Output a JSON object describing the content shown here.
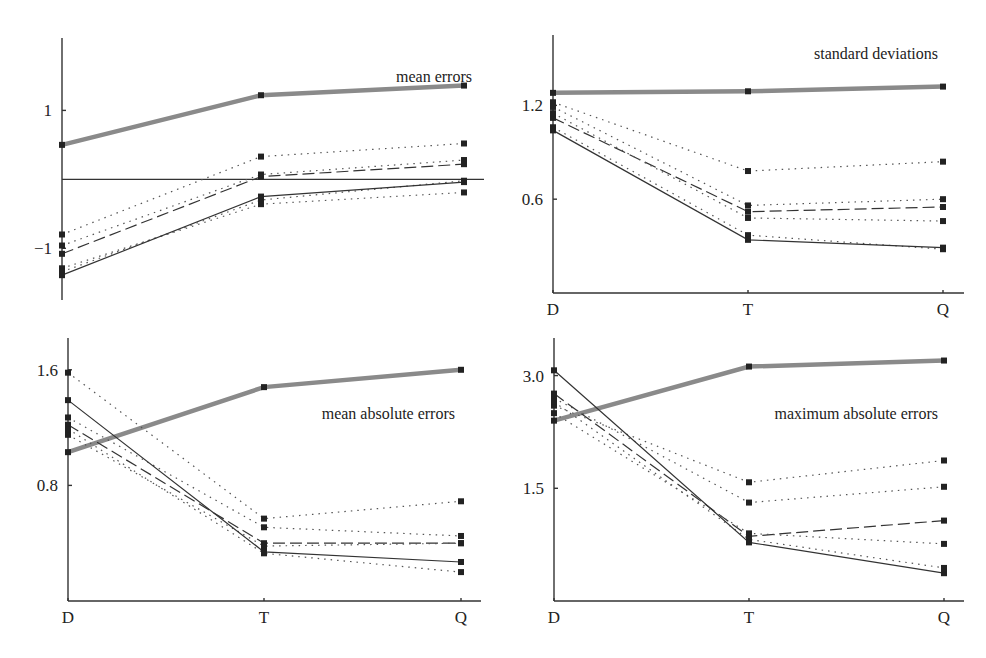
{
  "chart_data": [
    {
      "type": "line",
      "title": "mean errors",
      "categories": [
        "D",
        "T",
        "Q"
      ],
      "show_x_labels": false,
      "yticks": [
        {
          "value": 1,
          "label": "1"
        },
        {
          "value": -1,
          "label": "−1"
        }
      ],
      "ylim": [
        -1.75,
        2.05
      ],
      "zero_line": true,
      "series": [
        {
          "name": "heavy",
          "style": "heavy",
          "values": [
            0.5,
            1.22,
            1.36
          ]
        },
        {
          "name": "dotted-a",
          "style": "dotted",
          "values": [
            -0.8,
            0.33,
            0.52
          ]
        },
        {
          "name": "dotted-b",
          "style": "dotted",
          "values": [
            -0.96,
            0.07,
            0.28
          ]
        },
        {
          "name": "dashed",
          "style": "dashed",
          "values": [
            -1.08,
            0.04,
            0.22
          ]
        },
        {
          "name": "dotted-c",
          "style": "dotted",
          "values": [
            -1.29,
            -0.36,
            -0.19
          ]
        },
        {
          "name": "dotted-d",
          "style": "dotted",
          "values": [
            -1.34,
            -0.3,
            -0.02
          ]
        },
        {
          "name": "solid",
          "style": "solid",
          "values": [
            -1.39,
            -0.25,
            -0.04
          ]
        }
      ]
    },
    {
      "type": "line",
      "title": "standard deviations",
      "categories": [
        "D",
        "T",
        "Q"
      ],
      "show_x_labels": true,
      "yticks": [
        {
          "value": 1.2,
          "label": "1.2"
        },
        {
          "value": 0.6,
          "label": "0.6"
        }
      ],
      "ylim": [
        0.0,
        1.65
      ],
      "zero_line": false,
      "series": [
        {
          "name": "heavy",
          "style": "heavy",
          "values": [
            1.28,
            1.29,
            1.32
          ]
        },
        {
          "name": "dotted-a",
          "style": "dotted",
          "values": [
            1.22,
            0.78,
            0.84
          ]
        },
        {
          "name": "dotted-b",
          "style": "dotted",
          "values": [
            1.19,
            0.56,
            0.6
          ]
        },
        {
          "name": "dashed",
          "style": "dashed",
          "values": [
            1.12,
            0.52,
            0.55
          ]
        },
        {
          "name": "dotted-c",
          "style": "dotted",
          "values": [
            1.15,
            0.48,
            0.46
          ]
        },
        {
          "name": "dotted-d",
          "style": "dotted",
          "values": [
            1.06,
            0.37,
            0.28
          ]
        },
        {
          "name": "solid",
          "style": "solid",
          "values": [
            1.04,
            0.34,
            0.29
          ]
        }
      ]
    },
    {
      "type": "line",
      "title": "mean absolute errors",
      "categories": [
        "D",
        "T",
        "Q"
      ],
      "show_x_labels": true,
      "yticks": [
        {
          "value": 1.6,
          "label": "1.6"
        },
        {
          "value": 0.8,
          "label": "0.8"
        }
      ],
      "ylim": [
        0.0,
        1.82
      ],
      "zero_line": false,
      "series": [
        {
          "name": "heavy",
          "style": "heavy",
          "values": [
            1.03,
            1.48,
            1.6
          ]
        },
        {
          "name": "dotted-a",
          "style": "dotted",
          "values": [
            1.58,
            0.57,
            0.69
          ]
        },
        {
          "name": "dotted-b",
          "style": "dotted",
          "values": [
            1.27,
            0.51,
            0.45
          ]
        },
        {
          "name": "dashed",
          "style": "dashed",
          "values": [
            1.22,
            0.4,
            0.4
          ]
        },
        {
          "name": "dotted-c",
          "style": "dotted",
          "values": [
            1.15,
            0.38,
            0.4
          ]
        },
        {
          "name": "dotted-d",
          "style": "dotted",
          "values": [
            1.19,
            0.33,
            0.2
          ]
        },
        {
          "name": "solid",
          "style": "solid",
          "values": [
            1.39,
            0.34,
            0.27
          ]
        }
      ]
    },
    {
      "type": "line",
      "title": "maximum absolute errors",
      "categories": [
        "D",
        "T",
        "Q"
      ],
      "show_x_labels": true,
      "yticks": [
        {
          "value": 3.0,
          "label": "3.0"
        },
        {
          "value": 1.5,
          "label": "1.5"
        }
      ],
      "ylim": [
        0.0,
        3.5
      ],
      "zero_line": false,
      "series": [
        {
          "name": "heavy",
          "style": "heavy",
          "values": [
            2.4,
            3.12,
            3.2
          ]
        },
        {
          "name": "dotted-a",
          "style": "dotted",
          "values": [
            2.6,
            1.58,
            1.87
          ]
        },
        {
          "name": "dotted-b",
          "style": "dotted",
          "values": [
            2.7,
            1.31,
            1.52
          ]
        },
        {
          "name": "dashed",
          "style": "dashed",
          "values": [
            2.76,
            0.86,
            1.07
          ]
        },
        {
          "name": "dotted-c",
          "style": "dotted",
          "values": [
            2.5,
            0.9,
            0.76
          ]
        },
        {
          "name": "dotted-d",
          "style": "dotted",
          "values": [
            2.65,
            0.82,
            0.44
          ]
        },
        {
          "name": "solid",
          "style": "solid",
          "values": [
            3.07,
            0.78,
            0.37
          ]
        }
      ]
    }
  ],
  "panels_layout": [
    {
      "axis_x": 62,
      "x_positions": [
        62,
        261,
        464
      ],
      "y_top": 38,
      "y_bottom": 300,
      "x_right": 484,
      "title_x": 472,
      "title_y": 82,
      "title_anchor": "end"
    },
    {
      "axis_x": 553,
      "x_positions": [
        553,
        748,
        943
      ],
      "y_top": 35,
      "y_bottom": 293,
      "x_right": 964,
      "title_x": 938,
      "title_y": 59,
      "title_anchor": "end"
    },
    {
      "axis_x": 68,
      "x_positions": [
        68,
        264,
        461
      ],
      "y_top": 338,
      "y_bottom": 601,
      "x_right": 481,
      "title_x": 455,
      "title_y": 419,
      "title_anchor": "end"
    },
    {
      "axis_x": 554,
      "x_positions": [
        554,
        749,
        944
      ],
      "y_top": 338,
      "y_bottom": 601,
      "x_right": 964,
      "title_x": 938,
      "title_y": 419,
      "title_anchor": "end"
    }
  ],
  "colors": {
    "heavy": "#8a8a8a",
    "line": "#333333",
    "marker": "#222222"
  }
}
